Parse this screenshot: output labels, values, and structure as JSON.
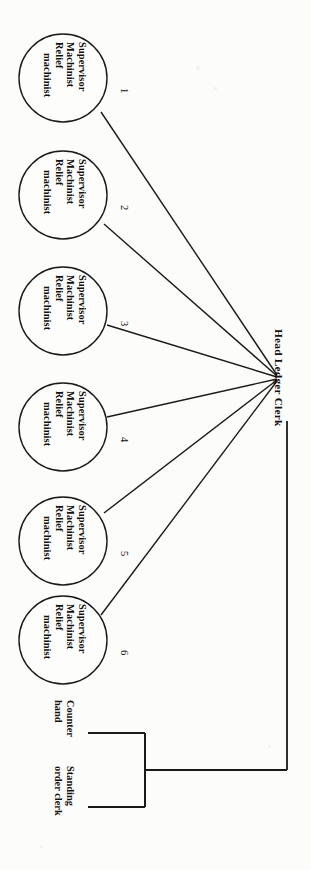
{
  "diagram": {
    "orientation": "rotated-90",
    "hub": {
      "label": "Head Ledger Clerk",
      "x": 278,
      "y": 378
    },
    "colors": {
      "line": "#1a1a1a",
      "text": "#111111",
      "background": "#fcfcfb",
      "node_fill": "#fdfdfc"
    },
    "machinist_nodes": [
      {
        "number": "1",
        "lines": [
          "Supervisor",
          "Machinist",
          "Relief",
          "machinist"
        ],
        "cx": 63,
        "cy": 78,
        "r": 44
      },
      {
        "number": "2",
        "lines": [
          "Supervisor",
          "Machinist",
          "Relief",
          "machinist"
        ],
        "cx": 63,
        "cy": 195,
        "r": 44
      },
      {
        "number": "3",
        "lines": [
          "Supervisor",
          "Machinist",
          "Relief",
          "machinist"
        ],
        "cx": 63,
        "cy": 311,
        "r": 44
      },
      {
        "number": "4",
        "lines": [
          "Supervisor",
          "Machinist",
          "Relief",
          "machinist"
        ],
        "cx": 63,
        "cy": 427,
        "r": 44
      },
      {
        "number": "5",
        "lines": [
          "Supervisor",
          "Machinist",
          "Relief",
          "machinist"
        ],
        "cx": 63,
        "cy": 541,
        "r": 44
      },
      {
        "number": "6",
        "lines": [
          "Supervisor",
          "Machinist",
          "Relief",
          "machinist"
        ],
        "cx": 63,
        "cy": 640,
        "r": 44
      }
    ],
    "leaf_nodes": [
      {
        "name": "counter-hand",
        "lines": [
          "Counter",
          "hand"
        ],
        "label_x": 76,
        "label_y": 700,
        "stub_y": 733
      },
      {
        "name": "standing-order-clerk",
        "lines": [
          "Standing",
          "order clerk"
        ],
        "label_x": 76,
        "label_y": 766,
        "stub_y": 807
      }
    ],
    "bracket": {
      "stub_left_x": 88,
      "spine_x": 145,
      "join_y": 770,
      "trunk_to_x": 287
    }
  }
}
